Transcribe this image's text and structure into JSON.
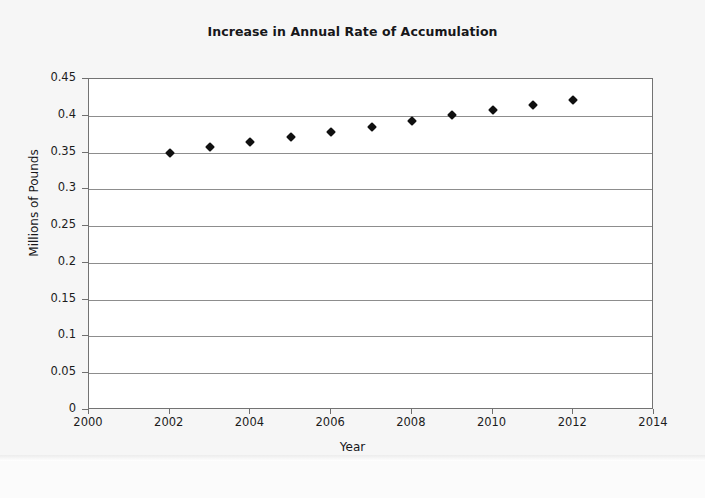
{
  "chart_data": {
    "type": "scatter",
    "title": "Increase in Annual Rate of Accumulation",
    "xlabel": "Year",
    "ylabel": "Millions of Pounds",
    "xlim": [
      2000,
      2014
    ],
    "ylim": [
      0,
      0.45
    ],
    "grid": true,
    "legend": null,
    "x_ticks": [
      2000,
      2002,
      2004,
      2006,
      2008,
      2010,
      2012,
      2014
    ],
    "x_tick_labels": [
      "2000",
      "2002",
      "2004",
      "2006",
      "2008",
      "2010",
      "2012",
      "2014"
    ],
    "y_ticks": [
      0,
      0.05,
      0.1,
      0.15,
      0.2,
      0.25,
      0.3,
      0.35,
      0.4,
      0.45
    ],
    "y_tick_labels": [
      "0",
      "0.05",
      "0.1",
      "0.15",
      "0.2",
      "0.25",
      "0.3",
      "0.35",
      "0.4",
      "0.45"
    ],
    "marker": "diamond",
    "marker_color": "#101010",
    "series": [
      {
        "name": "Annual Rate of Accumulation",
        "x": [
          2002,
          2003,
          2004,
          2005,
          2006,
          2007,
          2008,
          2009,
          2010,
          2011,
          2012
        ],
        "values": [
          0.35,
          0.357,
          0.364,
          0.371,
          0.378,
          0.385,
          0.393,
          0.401,
          0.408,
          0.415,
          0.422
        ]
      }
    ]
  },
  "page": {
    "background_color": "#f6f6f6",
    "plot_background_color": "#ffffff",
    "gridline_color": "#8d8d8d",
    "frame_color": "#737373",
    "text_color": "#17171a"
  }
}
